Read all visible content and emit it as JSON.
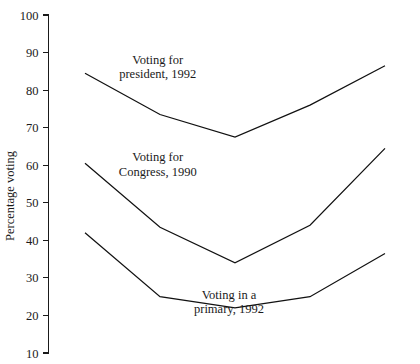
{
  "chart_data": {
    "type": "line",
    "title": "",
    "subtitle": "",
    "xlabel": "",
    "ylabel": "Percentage voting",
    "ylim": [
      10,
      100
    ],
    "ytick_labels": [
      "100",
      "90",
      "80",
      "70",
      "60",
      "50",
      "40",
      "30",
      "20",
      "10"
    ],
    "ytick_values": [
      100,
      90,
      80,
      70,
      60,
      50,
      40,
      30,
      20,
      10
    ],
    "xtick_labels": [],
    "x": [
      1,
      2,
      3,
      4,
      5
    ],
    "grid": false,
    "legend_position": "inline-annotations",
    "series": [
      {
        "name": "Voting for president, 1992",
        "values": [
          84.5,
          73.5,
          67.5,
          76.0,
          86.5
        ]
      },
      {
        "name": "Voting for Congress, 1990",
        "values": [
          60.5,
          43.5,
          34.0,
          44.0,
          64.5
        ]
      },
      {
        "name": "Voting in a primary, 1992",
        "values": [
          42.0,
          25.0,
          22.0,
          25.0,
          36.5
        ]
      }
    ],
    "annotations": [
      {
        "id": "president-annotation",
        "lines": [
          "Voting for",
          "president, 1992"
        ],
        "x": 1.97,
        "y": 87.0
      },
      {
        "id": "congress-annotation",
        "lines": [
          "Voting for",
          "Congress, 1990"
        ],
        "x": 1.97,
        "y": 61.0
      },
      {
        "id": "primary-annotation",
        "lines": [
          "Voting in a",
          "primary, 1992"
        ],
        "x": 2.92,
        "y": 24.5
      }
    ]
  },
  "style": {
    "line_color": "#111111",
    "axis_color": "#1a1a1a",
    "background": "#ffffff"
  }
}
